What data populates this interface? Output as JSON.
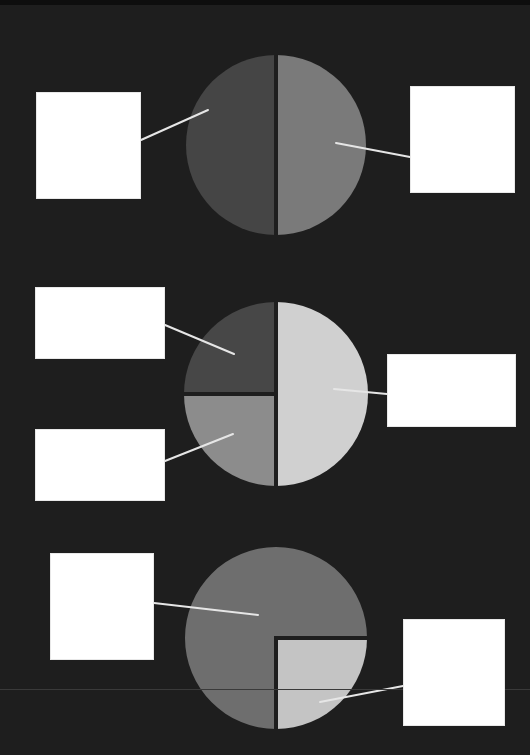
{
  "diagram": {
    "type": "fraction-pie-worksheet",
    "background": "#1e1e1e",
    "divider_color": "#1e1e1e",
    "leader_line_color": "#e6e6e6",
    "pies": [
      {
        "id": "pie-halves",
        "cx": 276,
        "cy": 145,
        "r": 90,
        "slices": [
          {
            "name": "left-half",
            "fraction": "1/2",
            "color": "#454545"
          },
          {
            "name": "right-half",
            "fraction": "1/2",
            "color": "#7a7a7a"
          }
        ]
      },
      {
        "id": "pie-quarters-half",
        "cx": 276,
        "cy": 394,
        "r": 92,
        "slices": [
          {
            "name": "top-left-quarter",
            "fraction": "1/4",
            "color": "#474747"
          },
          {
            "name": "bottom-left-quarter",
            "fraction": "1/4",
            "color": "#8c8c8c"
          },
          {
            "name": "right-half",
            "fraction": "1/2",
            "color": "#d0d0d0"
          }
        ]
      },
      {
        "id": "pie-three-quarters",
        "cx": 276,
        "cy": 638,
        "r": 91,
        "slices": [
          {
            "name": "three-quarter",
            "fraction": "3/4",
            "color": "#6e6e6e"
          },
          {
            "name": "bottom-right-quarter",
            "fraction": "1/4",
            "color": "#c4c4c4"
          }
        ]
      }
    ],
    "label_boxes": [
      {
        "name": "label-box-pie1-left",
        "x": 36,
        "y": 92,
        "w": 105,
        "h": 107,
        "text": ""
      },
      {
        "name": "label-box-pie1-right",
        "x": 410,
        "y": 86,
        "w": 105,
        "h": 107,
        "text": ""
      },
      {
        "name": "label-box-pie2-top-left",
        "x": 35,
        "y": 287,
        "w": 130,
        "h": 72,
        "text": ""
      },
      {
        "name": "label-box-pie2-bottom-left",
        "x": 35,
        "y": 429,
        "w": 130,
        "h": 72,
        "text": ""
      },
      {
        "name": "label-box-pie2-right",
        "x": 387,
        "y": 354,
        "w": 129,
        "h": 73,
        "text": ""
      },
      {
        "name": "label-box-pie3-left",
        "x": 50,
        "y": 553,
        "w": 104,
        "h": 107,
        "text": ""
      },
      {
        "name": "label-box-pie3-right",
        "x": 403,
        "y": 619,
        "w": 102,
        "h": 107,
        "text": ""
      }
    ],
    "leader_lines": [
      {
        "name": "leader-pie1-left",
        "x1": 141,
        "y1": 140,
        "x2": 208,
        "y2": 110
      },
      {
        "name": "leader-pie1-right",
        "x1": 336,
        "y1": 143,
        "x2": 410,
        "y2": 157
      },
      {
        "name": "leader-pie2-top-left",
        "x1": 165,
        "y1": 325,
        "x2": 234,
        "y2": 354
      },
      {
        "name": "leader-pie2-bottom-left",
        "x1": 165,
        "y1": 461,
        "x2": 233,
        "y2": 434
      },
      {
        "name": "leader-pie2-right",
        "x1": 334,
        "y1": 389,
        "x2": 387,
        "y2": 394
      },
      {
        "name": "leader-pie3-left",
        "x1": 154,
        "y1": 603,
        "x2": 258,
        "y2": 615
      },
      {
        "name": "leader-pie3-right",
        "x1": 320,
        "y1": 702,
        "x2": 403,
        "y2": 686
      }
    ]
  }
}
